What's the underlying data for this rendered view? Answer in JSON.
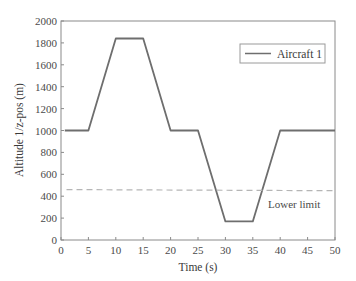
{
  "chart_data": {
    "type": "line",
    "title": "",
    "xlabel": "Time (s)",
    "ylabel": "Altitude 1/z-pos (m)",
    "xlim": [
      0,
      50
    ],
    "ylim": [
      0,
      2000
    ],
    "xticks": [
      0,
      5,
      10,
      15,
      20,
      25,
      30,
      35,
      40,
      45,
      50
    ],
    "yticks": [
      0,
      200,
      400,
      600,
      800,
      1000,
      1200,
      1400,
      1600,
      1800,
      2000
    ],
    "grid": false,
    "legend_position": "upper right",
    "series": [
      {
        "name": "Aircraft 1",
        "color": "#6e6e6e",
        "style": "solid",
        "x": [
          0.7,
          5,
          10,
          15,
          20,
          25,
          30,
          35,
          40,
          50
        ],
        "y": [
          1000,
          1000,
          1840,
          1840,
          1000,
          1000,
          170,
          170,
          1000,
          1000
        ]
      },
      {
        "name": "Lower limit",
        "color": "#b5b5b5",
        "style": "dashed",
        "x": [
          1,
          50
        ],
        "y": [
          460,
          450
        ]
      }
    ],
    "annotations": [
      {
        "text": "Lower limit",
        "x": 40.5,
        "y": 330
      }
    ]
  },
  "legend": {
    "label": "Aircraft 1"
  },
  "annotation_label": "Lower limit",
  "axes": {
    "xlabel": "Time (s)",
    "ylabel": "Altitude 1/z-pos (m)",
    "xtick_labels": [
      "0",
      "5",
      "10",
      "15",
      "20",
      "25",
      "30",
      "35",
      "40",
      "45",
      "50"
    ],
    "ytick_labels": [
      "0",
      "200",
      "400",
      "600",
      "800",
      "1000",
      "1200",
      "1400",
      "1600",
      "1800",
      "2000"
    ]
  }
}
